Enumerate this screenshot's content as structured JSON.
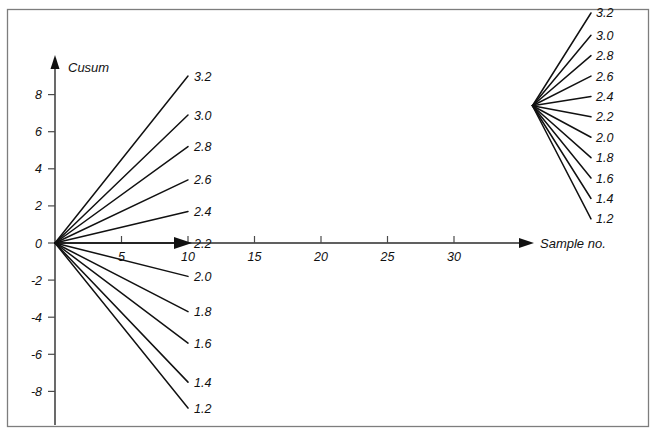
{
  "figure": {
    "background_color": "#ffffff",
    "frame_color": "#7d7d7d",
    "line_color": "#111111"
  },
  "chart_data": {
    "type": "line",
    "title": "",
    "subtitle": "",
    "xlabel": "Sample no.",
    "ylabel": "Cusum",
    "grid": false,
    "legend": "none",
    "xlim": [
      0,
      35
    ],
    "ylim": [
      -9,
      9
    ],
    "xticks": [
      5,
      10,
      15,
      20,
      25,
      30
    ],
    "xticklabels": [
      "5",
      "10",
      "15",
      "20",
      "25",
      "30"
    ],
    "yticks": [
      -8,
      -6,
      -4,
      -2,
      0,
      2,
      4,
      6,
      8
    ],
    "yticklabels": [
      "-8",
      "-6",
      "-4",
      "-2",
      "0",
      "2",
      "4",
      "6",
      "8"
    ],
    "annotation": "Cusum decision fan: V-mask slope lines radiating from origin, each labelled by its target mean value from 1.2 to 3.2 in steps of 0.2",
    "fan_left": {
      "name": "origin-fan",
      "origin": [
        0,
        0
      ],
      "labels": [
        "3.2",
        "3.0",
        "2.8",
        "2.6",
        "2.4",
        "2.2",
        "2.0",
        "1.8",
        "1.6",
        "1.4",
        "1.2"
      ],
      "values": [
        3.2,
        3.0,
        2.8,
        2.6,
        2.4,
        2.2,
        2.0,
        1.8,
        1.6,
        1.4,
        1.2
      ],
      "end_x": [
        10.0,
        10.0,
        10.0,
        10.0,
        10.0,
        10.0,
        10.0,
        10.0,
        10.0,
        10.0,
        10.0
      ],
      "end_y": [
        9.0,
        6.9,
        5.2,
        3.4,
        1.7,
        0.0,
        -1.8,
        -3.7,
        -5.4,
        -7.5,
        -8.9
      ]
    },
    "fan_right": {
      "name": "right-fan",
      "origin": [
        35.9,
        7.4
      ],
      "labels": [
        "3.2",
        "3.0",
        "2.8",
        "2.6",
        "2.4",
        "2.2",
        "2.0",
        "1.8",
        "1.6",
        "1.4",
        "1.2"
      ],
      "values": [
        3.2,
        3.0,
        2.8,
        2.6,
        2.4,
        2.2,
        2.0,
        1.8,
        1.6,
        1.4,
        1.2
      ],
      "end_x": [
        40.3,
        40.3,
        40.3,
        40.3,
        40.3,
        40.3,
        40.3,
        40.3,
        40.3,
        40.3,
        40.3
      ],
      "end_y": [
        12.4,
        11.2,
        10.1,
        9.0,
        7.9,
        6.8,
        5.7,
        4.6,
        3.5,
        2.4,
        1.3
      ]
    }
  },
  "axes": {
    "y_axis_label": "Cusum",
    "x_axis_label": "Sample no."
  }
}
